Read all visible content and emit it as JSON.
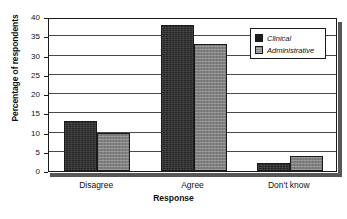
{
  "chart_data": {
    "type": "bar",
    "title": "",
    "xlabel": "Response",
    "ylabel": "Percentage of respondents",
    "categories": [
      "Disagree",
      "Agree",
      "Don't know"
    ],
    "series": [
      {
        "name": "Clinical",
        "values": [
          13,
          38,
          2
        ],
        "color": "#262626"
      },
      {
        "name": "Administrative",
        "values": [
          10,
          33,
          4
        ],
        "color": "#808080"
      }
    ],
    "ylim": [
      0,
      40
    ],
    "yticks": [
      0,
      5,
      10,
      15,
      20,
      25,
      30,
      35,
      40
    ],
    "ytick_labels": [
      "0",
      "5",
      "10",
      "15",
      "20",
      "25",
      "30",
      "35",
      "40"
    ],
    "grid": true,
    "grid_axis": "y",
    "legend_position": "top-right",
    "legend_entries": [
      "Clinical",
      "Administrative"
    ]
  }
}
